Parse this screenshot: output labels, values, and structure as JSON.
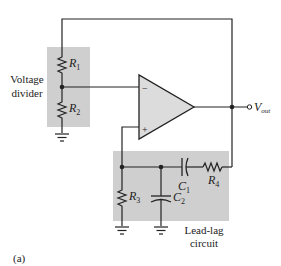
{
  "colors": {
    "wire": "#222222",
    "block_fill": "#cfcfcf",
    "opamp_fill": "#dcdcdc",
    "background": "#ffffff"
  },
  "labels": {
    "voltage_divider_line1": "Voltage",
    "voltage_divider_line2": "divider",
    "lead_lag_line1": "Lead-lag",
    "lead_lag_line2": "circuit",
    "figure_tag": "(a)",
    "vout_main": "V",
    "vout_sub": "out",
    "opamp_minus": "−",
    "opamp_plus": "+"
  },
  "components": {
    "r1": {
      "letter": "R",
      "sub": "1"
    },
    "r2": {
      "letter": "R",
      "sub": "2"
    },
    "r3": {
      "letter": "R",
      "sub": "3"
    },
    "r4": {
      "letter": "R",
      "sub": "4"
    },
    "c1": {
      "letter": "C",
      "sub": "1"
    },
    "c2": {
      "letter": "C",
      "sub": "2"
    }
  }
}
